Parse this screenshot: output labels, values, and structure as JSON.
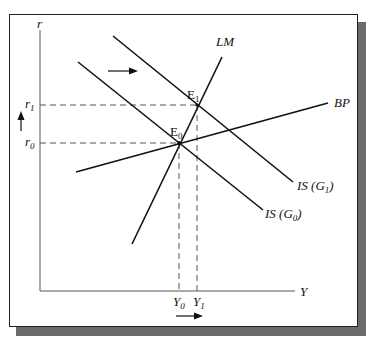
{
  "diagram": {
    "type": "IS-LM-BP",
    "axes": {
      "y_label": "r",
      "x_label": "Y"
    },
    "curves": {
      "lm": "LM",
      "bp": "BP",
      "is0": {
        "main": "IS (G",
        "sub": "0",
        "close": ")"
      },
      "is1": {
        "main": "IS (G",
        "sub": "1",
        "close": ")"
      }
    },
    "points": {
      "e0": {
        "main": "E",
        "sub": "0"
      },
      "e1": {
        "main": "E",
        "sub": "1"
      }
    },
    "ticks": {
      "r0": {
        "main": "r",
        "sub": "0"
      },
      "r1": {
        "main": "r",
        "sub": "1"
      },
      "y0": {
        "main": "Y",
        "sub": "0"
      },
      "y1": {
        "main": "Y",
        "sub": "1"
      }
    },
    "arrows": [
      "IS shift right",
      "r increase",
      "Y increase"
    ],
    "colors": {
      "line": "#111111",
      "axis": "#555555",
      "dash": "#555555",
      "shadow": "#6b6b6b"
    }
  }
}
